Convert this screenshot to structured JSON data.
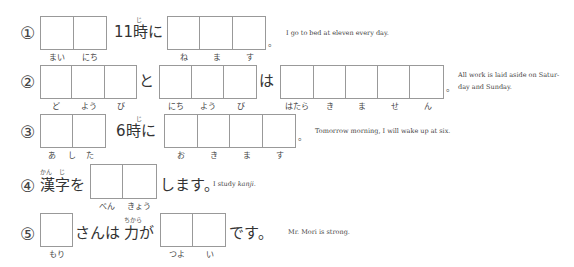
{
  "exercises": [
    {
      "number": "①",
      "groups": [
        {
          "cells": 2,
          "readings": [
            "まい",
            "にち"
          ]
        },
        {
          "cells": 3,
          "readings": [
            "ね",
            "ま",
            "す"
          ]
        }
      ],
      "texts": [
        "11時に",
        "。"
      ],
      "furigana": [
        "じ"
      ],
      "english": "I go to bed at eleven every day."
    },
    {
      "number": "②",
      "groups": [
        {
          "cells": 3,
          "readings": [
            "ど",
            "よう",
            "び"
          ]
        },
        {
          "cells": 3,
          "readings": [
            "にち",
            "よう",
            "び"
          ]
        },
        {
          "cells": 5,
          "readings": [
            "はたら",
            "き",
            "ま",
            "せ",
            "ん"
          ]
        }
      ],
      "texts": [
        "と",
        "は",
        "。"
      ],
      "english": "All work is laid aside on Saturday and Sunday.",
      "english_lines": [
        "All work is laid aside on Satur-",
        "day and Sunday."
      ]
    },
    {
      "number": "③",
      "groups": [
        {
          "cells": 2,
          "readings": [
            "あ",
            "し",
            "た"
          ]
        },
        {
          "cells": 4,
          "readings": [
            "お",
            "き",
            "ま",
            "す"
          ]
        }
      ],
      "texts": [
        "6時に",
        "。"
      ],
      "furigana": [
        "じ"
      ],
      "english": "Tomorrow morning, I will wake up at six."
    },
    {
      "number": "④",
      "groups": [
        {
          "cells": 2,
          "readings": [
            "べん",
            "きょう"
          ]
        }
      ],
      "texts": [
        "漢字を",
        "します。"
      ],
      "furigana": [
        "かん",
        "じ"
      ],
      "english_prefix": "I study ",
      "english_italic": "kanji",
      "english_suffix": "."
    },
    {
      "number": "⑤",
      "groups": [
        {
          "cells": 1,
          "readings": [
            "もり"
          ]
        },
        {
          "cells": 2,
          "readings": [
            "つよ",
            "い"
          ]
        }
      ],
      "texts": [
        "さんは",
        "力が",
        "です。"
      ],
      "furigana": [
        "ちから"
      ],
      "english": "Mr. Mori is strong."
    }
  ]
}
